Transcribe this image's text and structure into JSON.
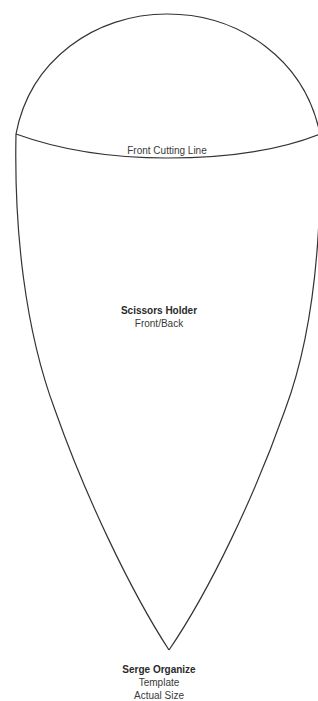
{
  "template": {
    "cutting_line_label": "Front Cutting Line",
    "piece": {
      "name": "Scissors Holder",
      "subtitle": "Front/Back"
    },
    "footer": {
      "brand": "Serge Organize",
      "line1": "Template",
      "line2": "Actual Size"
    },
    "stroke_color": "#333333",
    "background_color": "#ffffff"
  }
}
